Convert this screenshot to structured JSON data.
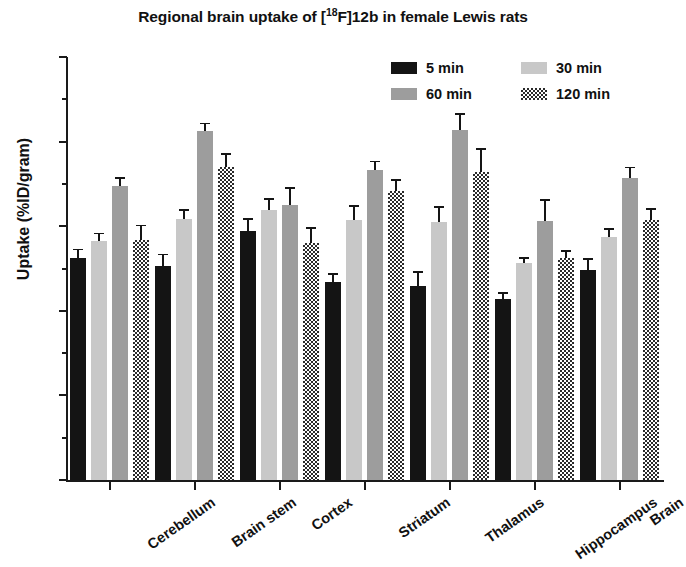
{
  "chart_data": {
    "type": "bar",
    "title": "Regional brain uptake of [18F]12b in female Lewis rats",
    "title_parts": {
      "before": "Regional brain uptake of [",
      "superscript": "18",
      "after": "F]12b in female Lewis rats"
    },
    "xlabel": "",
    "ylabel": "Uptake (%ID/gram)",
    "ylim": [
      0.0,
      1.0
    ],
    "ytick_labels": [
      "0.0",
      "0.2",
      "0.4",
      "0.6",
      "0.8",
      "1.0"
    ],
    "ytick_values": [
      0.0,
      0.2,
      0.4,
      0.6,
      0.8,
      1.0
    ],
    "yminor_values": [
      0.1,
      0.3,
      0.5,
      0.7,
      0.9
    ],
    "grid": false,
    "legend_position": "upper right",
    "categories": [
      "Cerebellum",
      "Brain stem",
      "Cortex",
      "Striatum",
      "Thalamus",
      "Hippocampus",
      "Brain"
    ],
    "series": [
      {
        "name": "5 min",
        "color": "#141414",
        "pattern": "solid-black",
        "values": [
          0.525,
          0.505,
          0.588,
          0.468,
          0.458,
          0.428,
          0.497
        ],
        "errors": [
          0.022,
          0.03,
          0.031,
          0.022,
          0.036,
          0.016,
          0.028
        ]
      },
      {
        "name": "30 min",
        "color": "#c8c8c8",
        "pattern": "light-gray",
        "values": [
          0.565,
          0.617,
          0.638,
          0.615,
          0.61,
          0.513,
          0.575
        ],
        "errors": [
          0.02,
          0.024,
          0.028,
          0.035,
          0.038,
          0.014,
          0.02
        ]
      },
      {
        "name": "60 min",
        "color": "#9d9d9d",
        "pattern": "medium-gray",
        "values": [
          0.695,
          0.825,
          0.65,
          0.733,
          0.827,
          0.613,
          0.713
        ],
        "errors": [
          0.022,
          0.02,
          0.043,
          0.022,
          0.041,
          0.052,
          0.028
        ]
      },
      {
        "name": "120 min",
        "color": "#2b2b2b",
        "pattern": "cross-hatch",
        "values": [
          0.567,
          0.74,
          0.56,
          0.683,
          0.728,
          0.525,
          0.615
        ],
        "errors": [
          0.037,
          0.033,
          0.037,
          0.029,
          0.056,
          0.019,
          0.028
        ]
      }
    ]
  },
  "legend": {
    "items": [
      {
        "label": "5 min"
      },
      {
        "label": "30 min"
      },
      {
        "label": "60 min"
      },
      {
        "label": "120 min"
      }
    ]
  }
}
